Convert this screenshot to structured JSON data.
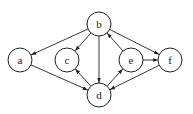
{
  "diagram": {
    "type": "directed-graph",
    "nodes": [
      {
        "id": "a",
        "label": "a",
        "x": 20,
        "y": 60
      },
      {
        "id": "b",
        "label": "b",
        "x": 99,
        "y": 24
      },
      {
        "id": "c",
        "label": "c",
        "x": 67,
        "y": 60
      },
      {
        "id": "d",
        "label": "d",
        "x": 99,
        "y": 95
      },
      {
        "id": "e",
        "label": "e",
        "x": 131,
        "y": 60
      },
      {
        "id": "f",
        "label": "f",
        "x": 170,
        "y": 60
      }
    ],
    "edges": [
      {
        "from": "b",
        "to": "a"
      },
      {
        "from": "b",
        "to": "c"
      },
      {
        "from": "b",
        "to": "d"
      },
      {
        "from": "b",
        "to": "f"
      },
      {
        "from": "e",
        "to": "b"
      },
      {
        "from": "e",
        "to": "f"
      },
      {
        "from": "a",
        "to": "d"
      },
      {
        "from": "d",
        "to": "c"
      },
      {
        "from": "d",
        "to": "e"
      },
      {
        "from": "f",
        "to": "d"
      }
    ]
  }
}
